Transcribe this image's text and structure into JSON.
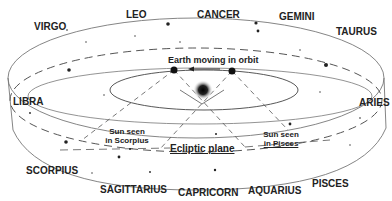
{
  "diagram": {
    "constellations": [
      {
        "name": "VIRGO",
        "x": 34,
        "y": 22
      },
      {
        "name": "LEO",
        "x": 126,
        "y": 10
      },
      {
        "name": "CANCER",
        "x": 197,
        "y": 10
      },
      {
        "name": "GEMINI",
        "x": 279,
        "y": 12
      },
      {
        "name": "TAURUS",
        "x": 336,
        "y": 27
      },
      {
        "name": "LIBRA",
        "x": 13,
        "y": 100
      },
      {
        "name": "ARIES",
        "x": 359,
        "y": 98
      },
      {
        "name": "SCORPIUS",
        "x": 26,
        "y": 166
      },
      {
        "name": "SAGITTARIUS",
        "x": 100,
        "y": 183
      },
      {
        "name": "CAPRICORN",
        "x": 178,
        "y": 186
      },
      {
        "name": "AQUARIUS",
        "x": 248,
        "y": 185
      },
      {
        "name": "PISCES",
        "x": 312,
        "y": 178
      }
    ],
    "annotations": {
      "earth_orbit": "Earth moving in orbit",
      "sun_scorpius_line1": "Sun seen",
      "sun_scorpius_line2": "in Scorpius",
      "sun_pisces_line1": "Sun seen",
      "sun_pisces_line2": "in Pisces",
      "ecliptic_plane": "Ecliptic plane"
    },
    "colors": {
      "line": "#555555",
      "text": "#222222",
      "sun": "#111111",
      "background": "#ffffff"
    }
  }
}
